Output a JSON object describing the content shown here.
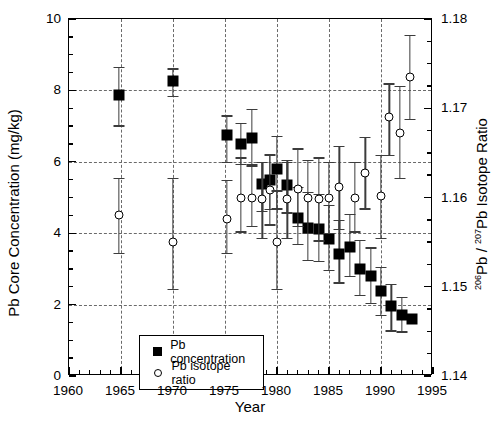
{
  "chart_data": {
    "type": "scatter",
    "title": "",
    "xlabel": "Year",
    "ylabel": "Pb Core Concentration (mg/kg)",
    "y2label": "206Pb / 207Pb Isotope Ratio",
    "xlim": [
      1960,
      1995
    ],
    "ylim": [
      0,
      10
    ],
    "y2lim": [
      1.14,
      1.18
    ],
    "xticks": [
      1960,
      1965,
      1970,
      1975,
      1980,
      1985,
      1990,
      1995
    ],
    "xtick_labels": [
      "1960",
      "1965",
      "1970",
      "1975",
      "1980",
      "1985",
      "1990",
      "1995"
    ],
    "yticks": [
      0,
      2,
      4,
      6,
      8,
      10
    ],
    "ytick_labels": [
      "0",
      "2",
      "4",
      "6",
      "8",
      "10"
    ],
    "y2ticks": [
      1.14,
      1.15,
      1.16,
      1.17,
      1.18
    ],
    "y2tick_labels": [
      "1.14",
      "1.15",
      "1.16",
      "1.17",
      "1.18"
    ],
    "x_minor_step": 1,
    "y_minor_step": 0.5,
    "y2_minor_step": 0.0025,
    "grid": "dashed horizontal at y=2,4,6,8 and vertical at x=1965,1970,1975,1980,1985,1990",
    "legend_position": "lower left inside axes",
    "series": [
      {
        "name": "Pb concentration",
        "marker": "filled-square",
        "color": "#000000",
        "axis": "left",
        "points": [
          {
            "x": 1964.8,
            "y": 7.88,
            "yerr_low": 7.02,
            "yerr_high": 8.65
          },
          {
            "x": 1970.0,
            "y": 8.25,
            "yerr_low": 7.85,
            "yerr_high": 8.62
          },
          {
            "x": 1975.2,
            "y": 6.75,
            "yerr_low": 6.0,
            "yerr_high": 7.3
          },
          {
            "x": 1976.5,
            "y": 6.5,
            "yerr_low": 5.95,
            "yerr_high": 7.1
          },
          {
            "x": 1977.6,
            "y": 6.68,
            "yerr_low": 5.9,
            "yerr_high": 7.48
          },
          {
            "x": 1978.6,
            "y": 5.38,
            "yerr_low": 4.62,
            "yerr_high": 6.0
          },
          {
            "x": 1979.3,
            "y": 5.5,
            "yerr_low": 4.68,
            "yerr_high": 6.22
          },
          {
            "x": 1980.0,
            "y": 5.8,
            "yerr_low": 4.7,
            "yerr_high": 6.72
          },
          {
            "x": 1981.0,
            "y": 5.35,
            "yerr_low": 4.58,
            "yerr_high": 6.05
          },
          {
            "x": 1982.0,
            "y": 4.42,
            "yerr_low": 3.7,
            "yerr_high": 5.3
          },
          {
            "x": 1983.0,
            "y": 4.15,
            "yerr_low": 3.25,
            "yerr_high": 5.15
          },
          {
            "x": 1984.0,
            "y": 4.12,
            "yerr_low": 3.22,
            "yerr_high": 5.1
          },
          {
            "x": 1985.0,
            "y": 3.85,
            "yerr_low": 2.98,
            "yerr_high": 4.8
          },
          {
            "x": 1986.0,
            "y": 3.42,
            "yerr_low": 2.62,
            "yerr_high": 4.38
          },
          {
            "x": 1987.0,
            "y": 3.62,
            "yerr_low": 2.8,
            "yerr_high": 4.55
          },
          {
            "x": 1988.0,
            "y": 3.0,
            "yerr_low": 2.28,
            "yerr_high": 3.82
          },
          {
            "x": 1989.0,
            "y": 2.8,
            "yerr_low": 2.05,
            "yerr_high": 3.6
          },
          {
            "x": 1990.0,
            "y": 2.38,
            "yerr_low": 1.72,
            "yerr_high": 3.05
          },
          {
            "x": 1991.0,
            "y": 1.95,
            "yerr_low": 1.28,
            "yerr_high": 2.58
          },
          {
            "x": 1992.0,
            "y": 1.72,
            "yerr_low": 1.25,
            "yerr_high": 2.22
          },
          {
            "x": 1993.0,
            "y": 1.6,
            "yerr_low": 1.6,
            "yerr_high": 1.6
          }
        ]
      },
      {
        "name": "Pb isotope ratio",
        "marker": "open-circle",
        "color": "#000000",
        "axis": "right",
        "points": [
          {
            "x": 1964.8,
            "y": 1.158,
            "yerr_low": 1.1538,
            "yerr_high": 1.1622
          },
          {
            "x": 1970.0,
            "y": 1.155,
            "yerr_low": 1.1498,
            "yerr_high": 1.1622
          },
          {
            "x": 1975.2,
            "y": 1.1576,
            "yerr_low": 1.1538,
            "yerr_high": 1.162
          },
          {
            "x": 1976.5,
            "y": 1.16,
            "yerr_low": 1.1562,
            "yerr_high": 1.1645
          },
          {
            "x": 1977.6,
            "y": 1.16,
            "yerr_low": 1.1568,
            "yerr_high": 1.1638
          },
          {
            "x": 1978.6,
            "y": 1.1598,
            "yerr_low": 1.1555,
            "yerr_high": 1.164
          },
          {
            "x": 1979.3,
            "y": 1.1608,
            "yerr_low": 1.157,
            "yerr_high": 1.1648
          },
          {
            "x": 1980.0,
            "y": 1.155,
            "yerr_low": 1.1498,
            "yerr_high": 1.1608
          },
          {
            "x": 1981.0,
            "y": 1.1598,
            "yerr_low": 1.1555,
            "yerr_high": 1.164
          },
          {
            "x": 1982.0,
            "y": 1.161,
            "yerr_low": 1.1568,
            "yerr_high": 1.1655
          },
          {
            "x": 1983.0,
            "y": 1.16,
            "yerr_low": 1.156,
            "yerr_high": 1.1642
          },
          {
            "x": 1984.0,
            "y": 1.1598,
            "yerr_low": 1.1552,
            "yerr_high": 1.1645
          },
          {
            "x": 1985.0,
            "y": 1.16,
            "yerr_low": 1.156,
            "yerr_high": 1.164
          },
          {
            "x": 1986.0,
            "y": 1.1612,
            "yerr_low": 1.1565,
            "yerr_high": 1.1658
          },
          {
            "x": 1987.5,
            "y": 1.16,
            "yerr_low": 1.1562,
            "yerr_high": 1.164
          },
          {
            "x": 1988.5,
            "y": 1.1628,
            "yerr_low": 1.1588,
            "yerr_high": 1.1668
          },
          {
            "x": 1990.0,
            "y": 1.1602,
            "yerr_low": 1.1555,
            "yerr_high": 1.1648
          },
          {
            "x": 1990.8,
            "y": 1.169,
            "yerr_low": 1.1648,
            "yerr_high": 1.1728
          },
          {
            "x": 1991.8,
            "y": 1.1672,
            "yerr_low": 1.1622,
            "yerr_high": 1.1725
          },
          {
            "x": 1992.8,
            "y": 1.1735,
            "yerr_low": 1.1688,
            "yerr_high": 1.1782
          }
        ]
      }
    ],
    "legend": [
      {
        "label": "Pb concentration",
        "marker": "filled-square"
      },
      {
        "label": "Pb isotope ratio",
        "marker": "open-circle"
      }
    ]
  }
}
